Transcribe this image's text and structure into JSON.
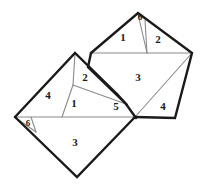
{
  "figure": {
    "width": 203,
    "height": 190,
    "colors": {
      "background": "#ffffff",
      "bold_edge": "#1a1a1a",
      "thin_edge": "#8a8a8a",
      "label_text": "#1a1a1a"
    }
  },
  "pieces": [
    {
      "id": "p1-right",
      "label": "1",
      "x": 123,
      "y": 38,
      "size": "lg"
    },
    {
      "id": "p2-right",
      "label": "2",
      "x": 158,
      "y": 40,
      "size": "lg"
    },
    {
      "id": "p6-right",
      "label": "6",
      "x": 140,
      "y": 17,
      "size": "sm"
    },
    {
      "id": "p3-right",
      "label": "3",
      "x": 138,
      "y": 78,
      "size": "lg"
    },
    {
      "id": "p4-right",
      "label": "4",
      "x": 163,
      "y": 107,
      "size": "lg"
    },
    {
      "id": "p5-center",
      "label": "5",
      "x": 116,
      "y": 107,
      "size": "lg"
    },
    {
      "id": "p2-left",
      "label": "2",
      "x": 85,
      "y": 78,
      "size": "lg"
    },
    {
      "id": "p1-left",
      "label": "1",
      "x": 74,
      "y": 103,
      "size": "lg"
    },
    {
      "id": "p4-left",
      "label": "4",
      "x": 48,
      "y": 96,
      "size": "lg"
    },
    {
      "id": "p6-left",
      "label": "6",
      "x": 28,
      "y": 123,
      "size": "sm"
    },
    {
      "id": "p3-left",
      "label": "3",
      "x": 75,
      "y": 143,
      "size": "lg"
    }
  ],
  "geometry": {
    "outlines": {
      "right_square_upper": "M 91,53 L 138,13 L 192,53",
      "right_square_lower": "M 192,53 L 175,118 L 135,117",
      "right_square_left": "M 91,53 L 135,117",
      "left_square_top": "M 15,117 L 75,53 L 117,94",
      "left_square_right": "M 117,94 L 126,104",
      "lower_square": "M 15,117 L 77,177 L 135,117",
      "bold_inner": "M 91,53 L 88,66 L 126,104 L 135,117"
    },
    "cuts": {
      "upper_gray_line": "M 91,53 L 192,53",
      "lower_gray_line": "M 15,117 L 135,117",
      "cut_6_right": "M 138,13 L 147,53",
      "cut_1_2_right": "M 145,21 L 147,53",
      "cut_3_4_right": "M 192,53 L 135,117",
      "cut_left_diag": "M 75,53 L 73,85",
      "cut_1_2_left": "M 73,85 L 126,104",
      "cut_1_apex": "M 73,85 L 62,117",
      "cut_6_left": "M 15,117 L 35,131",
      "cut_6_left_b": "M 30,117 L 35,131"
    }
  }
}
